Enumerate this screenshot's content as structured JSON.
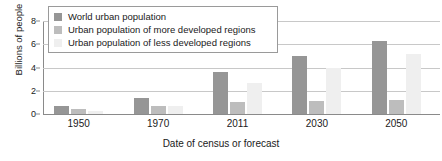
{
  "chart_data": {
    "type": "bar",
    "title": "",
    "xlabel": "Date of census or forecast",
    "ylabel": "Billions of people",
    "categories": [
      "1950",
      "1970",
      "2011",
      "2030",
      "2050"
    ],
    "series": [
      {
        "name": "World urban population",
        "color": "#969696",
        "values": [
          0.73,
          1.35,
          3.65,
          5.0,
          6.3
        ]
      },
      {
        "name": "Urban population of more developed regions",
        "color": "#bdbdbd",
        "values": [
          0.45,
          0.65,
          1.0,
          1.15,
          1.2
        ]
      },
      {
        "name": "Urban population of less developed regions",
        "color": "#efefef",
        "values": [
          0.3,
          0.65,
          2.65,
          4.0,
          5.2
        ]
      }
    ],
    "ylim": [
      0,
      8
    ],
    "yticks": [
      0,
      2,
      4,
      6,
      8
    ],
    "ytick_labels": [
      "0",
      "2",
      "4",
      "6",
      "8"
    ],
    "grid": true,
    "legend_position": "top-left"
  },
  "legend": {
    "items": [
      {
        "label": "World urban population"
      },
      {
        "label": "Urban population of more developed regions"
      },
      {
        "label": "Urban population of less developed regions"
      }
    ]
  }
}
